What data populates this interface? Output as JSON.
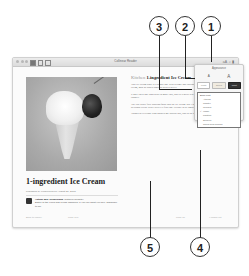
{
  "window": {
    "title": "Collinear Reader",
    "toolbar_left_icons": [
      "library-icon",
      "sidebar-icon",
      "share-icon"
    ],
    "toolbar_right_icons": [
      "appearance-icon",
      "search-icon",
      "bookmark-icon"
    ]
  },
  "article": {
    "title": "1-ingredient Ice Cream",
    "byline": "Published by ecoblivious on August 27, 2008",
    "author_name": "Author Bio: ecoblivious",
    "author_link": "(author's website)",
    "author_bio": "Editor of the Food and Living channels. If you like what you see, subscribe to me",
    "kicker_category": "Kitchen",
    "kicker_title": "1-ingredient Ice Cream",
    "paragraphs": [
      "This ice cream story is a simple one with creamy and luscious results without added sugar, cream, milk or added sugar or preservatives.",
      "It only takes one ingredient to make this, and it's a great way to use bananas ripening on the counter.",
      "The true super fruit addition folds into the ice cream. But I challenge you to try this delicious recipe with FROZEN fruit too. Prepare to be amazed.",
      "Thanks to everyone who pointed me toward this, and to the ones featured at last."
    ],
    "footer": [
      "Back to Library",
      "Page 168",
      "Page 18",
      "4 pages left"
    ]
  },
  "appearance_popover": {
    "title": "Appearance",
    "font_size_small": "A",
    "font_size_large": "A",
    "themes": [
      {
        "name": "White",
        "color": "#ffffff"
      },
      {
        "name": "Sepia",
        "color": "#f0ebe0"
      },
      {
        "name": "Night",
        "color": "#333333"
      }
    ],
    "font_list_header": "Book Font",
    "fonts": [
      "Athelas",
      "Charter",
      "Georgia",
      "Iowan",
      "Palatino",
      "Seravek",
      "Times New Roman"
    ],
    "selected_font": "Iowan"
  },
  "callouts": [
    "1",
    "2",
    "3",
    "4",
    "5"
  ]
}
